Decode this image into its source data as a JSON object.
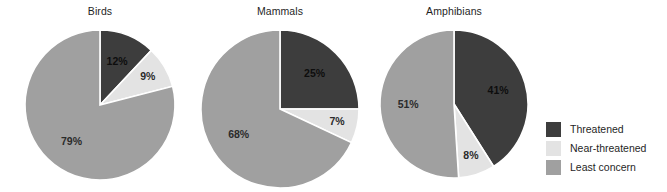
{
  "chart_data": [
    {
      "type": "pie",
      "title": "Birds",
      "categories": [
        "Threatened",
        "Near-threatened",
        "Least concern"
      ],
      "values": [
        12,
        9,
        79
      ],
      "labels": [
        "12%",
        "9%",
        "79%"
      ],
      "colors": [
        "#3d3d3d",
        "#e3e3e3",
        "#a0a0a0"
      ],
      "start_angle_deg": 0,
      "direction": "clockwise",
      "legend_position": "right"
    },
    {
      "type": "pie",
      "title": "Mammals",
      "categories": [
        "Threatened",
        "Near-threatened",
        "Least concern"
      ],
      "values": [
        25,
        7,
        68
      ],
      "labels": [
        "25%",
        "7%",
        "68%"
      ],
      "colors": [
        "#3d3d3d",
        "#e3e3e3",
        "#a0a0a0"
      ],
      "start_angle_deg": 0,
      "direction": "clockwise",
      "legend_position": "right"
    },
    {
      "type": "pie",
      "title": "Amphibians",
      "categories": [
        "Threatened",
        "Near-threatened",
        "Least concern"
      ],
      "values": [
        41,
        8,
        51
      ],
      "labels": [
        "41%",
        "8%",
        "51%"
      ],
      "colors": [
        "#3d3d3d",
        "#e3e3e3",
        "#a0a0a0"
      ],
      "start_angle_deg": 0,
      "direction": "clockwise",
      "legend_position": "right"
    }
  ],
  "charts": [
    {
      "title": "Birds",
      "slices": [
        {
          "name": "Threatened",
          "value": 12,
          "label": "12%",
          "color": "#3d3d3d",
          "label_tone": "dark"
        },
        {
          "name": "Near-threatened",
          "value": 9,
          "label": "9%",
          "color": "#e3e3e3",
          "label_tone": "light"
        },
        {
          "name": "Least concern",
          "value": 79,
          "label": "79%",
          "color": "#a0a0a0",
          "label_tone": "mid"
        }
      ]
    },
    {
      "title": "Mammals",
      "slices": [
        {
          "name": "Threatened",
          "value": 25,
          "label": "25%",
          "color": "#3d3d3d",
          "label_tone": "dark"
        },
        {
          "name": "Near-threatened",
          "value": 7,
          "label": "7%",
          "color": "#e3e3e3",
          "label_tone": "light"
        },
        {
          "name": "Least concern",
          "value": 68,
          "label": "68%",
          "color": "#a0a0a0",
          "label_tone": "mid"
        }
      ]
    },
    {
      "title": "Amphibians",
      "slices": [
        {
          "name": "Threatened",
          "value": 41,
          "label": "41%",
          "color": "#3d3d3d",
          "label_tone": "dark"
        },
        {
          "name": "Near-threatened",
          "value": 8,
          "label": "8%",
          "color": "#e3e3e3",
          "label_tone": "light"
        },
        {
          "name": "Least concern",
          "value": 51,
          "label": "51%",
          "color": "#a0a0a0",
          "label_tone": "mid"
        }
      ]
    }
  ],
  "legend": {
    "items": [
      {
        "label": "Threatened",
        "color": "#3d3d3d"
      },
      {
        "label": "Near-threatened",
        "color": "#e3e3e3"
      },
      {
        "label": "Least concern",
        "color": "#a0a0a0"
      }
    ]
  },
  "style": {
    "background": "#ffffff",
    "slice_gap_color": "#ffffff",
    "text_color": "#1f1f1f"
  }
}
